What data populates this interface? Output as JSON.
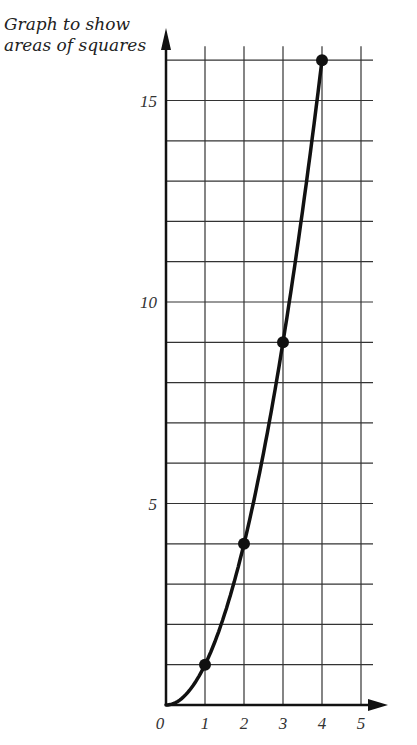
{
  "title_lines": [
    "Graph to show",
    "areas of squares"
  ],
  "chart_data": {
    "type": "line",
    "title": "Graph to show areas of squares",
    "xlabel": "",
    "ylabel": "",
    "x": [
      0,
      1,
      2,
      3,
      4
    ],
    "series": [
      {
        "name": "area",
        "values": [
          0,
          1,
          4,
          9,
          16
        ],
        "markers": [
          1,
          2,
          3,
          4
        ]
      }
    ],
    "x_ticks": [
      "0",
      "1",
      "2",
      "3",
      "4",
      "5"
    ],
    "y_ticks": [
      "5",
      "10",
      "15"
    ],
    "xlim": [
      0,
      5
    ],
    "ylim": [
      0,
      16
    ],
    "grid": true,
    "legend": "none"
  }
}
